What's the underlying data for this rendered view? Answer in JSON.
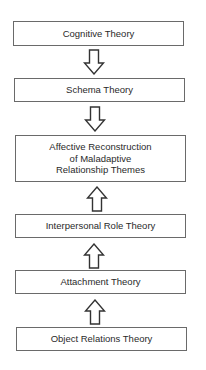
{
  "diagram": {
    "boxes": [
      {
        "id": "cognitive",
        "label": "Cognitive Theory"
      },
      {
        "id": "schema",
        "label": "Schema Theory"
      },
      {
        "id": "affective",
        "label": "Affective Reconstruction\nof Maladaptive\nRelationship Themes"
      },
      {
        "id": "interpersonal",
        "label": "Interpersonal Role Theory"
      },
      {
        "id": "attachment",
        "label": "Attachment Theory"
      },
      {
        "id": "object-relations",
        "label": "Object Relations Theory"
      }
    ],
    "arrows": [
      {
        "from": "Cognitive Theory",
        "to": "Schema Theory",
        "direction": "down"
      },
      {
        "from": "Schema Theory",
        "to": "Affective Reconstruction of Maladaptive Relationship Themes",
        "direction": "down"
      },
      {
        "from": "Interpersonal Role Theory",
        "to": "Affective Reconstruction of Maladaptive Relationship Themes",
        "direction": "up"
      },
      {
        "from": "Attachment Theory",
        "to": "Interpersonal Role Theory",
        "direction": "up"
      },
      {
        "from": "Object Relations Theory",
        "to": "Attachment Theory",
        "direction": "up"
      }
    ]
  },
  "colors": {
    "border": "#6a6a6a",
    "text": "#2a2a2a",
    "background": "#ffffff"
  }
}
